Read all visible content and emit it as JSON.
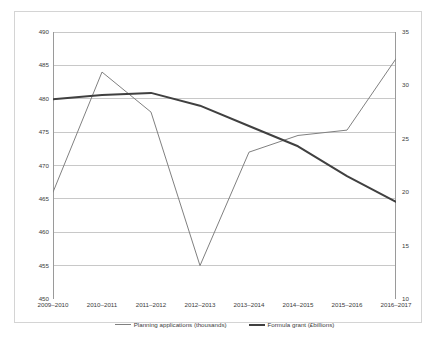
{
  "chart_data": {
    "type": "line",
    "title": "",
    "subtitle": "",
    "xlabel": "",
    "ylabel": "",
    "grid": true,
    "legend_position": "bottom",
    "categories": [
      "2009–2010",
      "2010–2011",
      "2011–2012",
      "2012–2013",
      "2013–2014",
      "2014–2015",
      "2015–2016",
      "2016–2017"
    ],
    "axes": {
      "left": {
        "label": "",
        "ylim": [
          450,
          490
        ],
        "tick_step": 5,
        "ticks": [
          450,
          455,
          460,
          465,
          470,
          475,
          480,
          485,
          490
        ],
        "tick_labels": [
          "450",
          "455",
          "460",
          "465",
          "470",
          "475",
          "480",
          "485",
          "490"
        ]
      },
      "right": {
        "label": "",
        "ylim": [
          10,
          35
        ],
        "tick_step": 5,
        "ticks": [
          10,
          15,
          20,
          25,
          30,
          35
        ],
        "tick_labels": [
          "10",
          "15",
          "20",
          "25",
          "30",
          "35"
        ]
      }
    },
    "series": [
      {
        "name": "Planning applications (thousands)",
        "axis": "left",
        "color": "#808080",
        "line_width": 1,
        "values": [
          466,
          484,
          478,
          455,
          472,
          474.5,
          475.3,
          486
        ]
      },
      {
        "name": "Formula grant (£billions)",
        "axis": "right",
        "color": "#404040",
        "line_width": 2,
        "values": [
          28.7,
          29.1,
          29.3,
          28.1,
          26.2,
          24.3,
          21.5,
          19.1
        ]
      }
    ]
  },
  "legend": {
    "items": [
      {
        "label": "Planning applications (thousands)"
      },
      {
        "label": "Formula grant (£billions)"
      }
    ]
  },
  "colors": {
    "planning_line": "#808080",
    "grant_line": "#404040",
    "gridline": "#c8c8c8",
    "axis": "#9a9a9a",
    "frame": "#d4d4d4",
    "text": "#3c3c3c"
  }
}
